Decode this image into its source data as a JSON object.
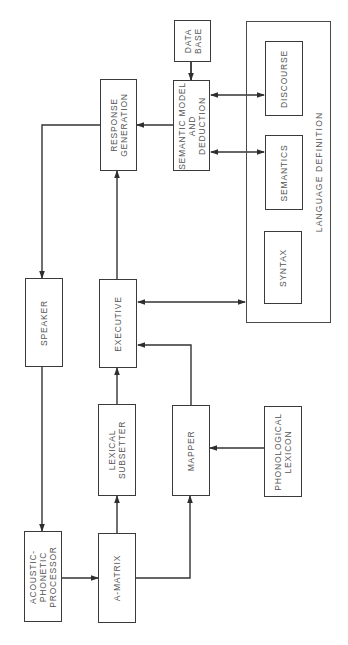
{
  "diagram": {
    "colors": {
      "line": "#333333",
      "text": "#555555",
      "background": "#ffffff"
    },
    "language_definition": {
      "label": "LANGUAGE DEFINITION",
      "components": {
        "discourse": "DISCOURSE",
        "semantics": "SEMANTICS",
        "syntax": "SYNTAX"
      }
    },
    "nodes": {
      "data_base": "DATA\nBASE",
      "semantic_model": "SEMANTIC MODEL\nAND\nDEDUCTION",
      "response_generation": "RESPONSE\nGENERATION",
      "speaker": "SPEAKER",
      "executive": "EXECUTIVE",
      "lexical_subsetter": "LEXICAL\nSUBSETTER",
      "mapper": "MAPPER",
      "phonological_lexicon": "PHONOLOGICAL\nLEXICON",
      "acoustic_phonetic_processor": "ACOUSTIC-\nPHONETIC\nPROCESSOR",
      "a_matrix": "A-MATRIX"
    },
    "edges": [
      {
        "from": "DATA BASE",
        "to": "SEMANTIC MODEL AND DEDUCTION",
        "type": "directed"
      },
      {
        "from": "SEMANTIC MODEL AND DEDUCTION",
        "to": "DISCOURSE",
        "type": "bidirectional"
      },
      {
        "from": "SEMANTIC MODEL AND DEDUCTION",
        "to": "SEMANTICS",
        "type": "bidirectional"
      },
      {
        "from": "SEMANTIC MODEL AND DEDUCTION",
        "to": "RESPONSE GENERATION",
        "type": "directed"
      },
      {
        "from": "RESPONSE GENERATION",
        "to": "SPEAKER",
        "type": "directed"
      },
      {
        "from": "EXECUTIVE",
        "to": "RESPONSE GENERATION",
        "type": "directed"
      },
      {
        "from": "EXECUTIVE",
        "to": "LANGUAGE DEFINITION",
        "type": "bidirectional"
      },
      {
        "from": "LEXICAL SUBSETTER",
        "to": "EXECUTIVE",
        "type": "directed"
      },
      {
        "from": "MAPPER",
        "to": "EXECUTIVE",
        "type": "directed"
      },
      {
        "from": "PHONOLOGICAL LEXICON",
        "to": "MAPPER",
        "type": "directed"
      },
      {
        "from": "SPEAKER",
        "to": "ACOUSTIC-PHONETIC PROCESSOR",
        "type": "directed"
      },
      {
        "from": "ACOUSTIC-PHONETIC PROCESSOR",
        "to": "A-MATRIX",
        "type": "directed"
      },
      {
        "from": "A-MATRIX",
        "to": "LEXICAL SUBSETTER",
        "type": "directed"
      },
      {
        "from": "A-MATRIX",
        "to": "MAPPER",
        "type": "directed"
      }
    ]
  }
}
